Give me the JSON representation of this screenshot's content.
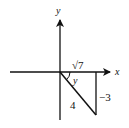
{
  "diagram": {
    "type": "right-triangle-on-coordinate-axes",
    "axes": {
      "x_label": "x",
      "y_label": "y"
    },
    "triangle": {
      "quadrant": "IV",
      "adjacent_side_label": "√7",
      "opposite_side_label": "−3",
      "hypotenuse_label": "4",
      "angle_label": "y"
    },
    "colors": {
      "line": "#111111",
      "background": "#ffffff"
    }
  }
}
